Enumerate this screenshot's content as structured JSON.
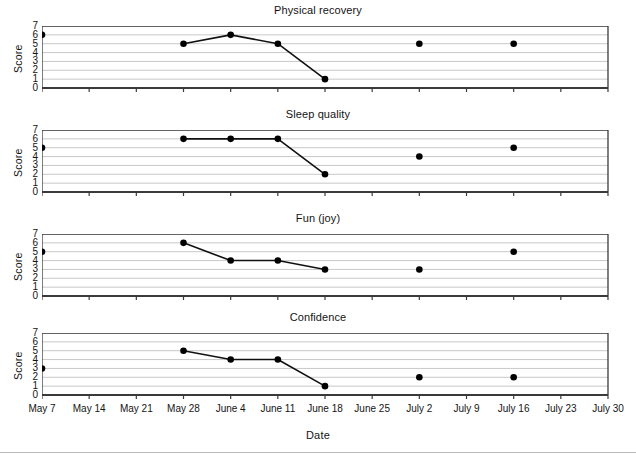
{
  "figure": {
    "xlabel": "Date",
    "ylabel": "Score"
  },
  "chart_data": [
    {
      "type": "line",
      "title": "Physical recovery",
      "xlabel": "Date",
      "ylabel": "Score",
      "ylim": [
        0,
        7
      ],
      "yticks": [
        0,
        1,
        2,
        3,
        4,
        5,
        6,
        7
      ],
      "grid": true,
      "legend": "none",
      "x": [
        "May 7",
        "May 14",
        "May 21",
        "May 28",
        "June 4",
        "June 11",
        "June 18",
        "June 25",
        "July 2",
        "July 9",
        "July 16",
        "July 23",
        "July 30"
      ],
      "points": [
        {
          "x": "May 7",
          "y": 6,
          "connected": false
        },
        {
          "x": "May 28",
          "y": 5,
          "connected": true
        },
        {
          "x": "June 4",
          "y": 6,
          "connected": true
        },
        {
          "x": "June 11",
          "y": 5,
          "connected": true
        },
        {
          "x": "June 18",
          "y": 1,
          "connected": true
        },
        {
          "x": "July 2",
          "y": 5,
          "connected": false
        },
        {
          "x": "July 16",
          "y": 5,
          "connected": false
        }
      ]
    },
    {
      "type": "line",
      "title": "Sleep quality",
      "xlabel": "Date",
      "ylabel": "Score",
      "ylim": [
        0,
        7
      ],
      "yticks": [
        0,
        1,
        2,
        3,
        4,
        5,
        6,
        7
      ],
      "grid": true,
      "legend": "none",
      "x": [
        "May 7",
        "May 14",
        "May 21",
        "May 28",
        "June 4",
        "June 11",
        "June 18",
        "June 25",
        "July 2",
        "July 9",
        "July 16",
        "July 23",
        "July 30"
      ],
      "points": [
        {
          "x": "May 7",
          "y": 5,
          "connected": false
        },
        {
          "x": "May 28",
          "y": 6,
          "connected": true
        },
        {
          "x": "June 4",
          "y": 6,
          "connected": true
        },
        {
          "x": "June 11",
          "y": 6,
          "connected": true
        },
        {
          "x": "June 18",
          "y": 2,
          "connected": true
        },
        {
          "x": "July 2",
          "y": 4,
          "connected": false
        },
        {
          "x": "July 16",
          "y": 5,
          "connected": false
        }
      ]
    },
    {
      "type": "line",
      "title": "Fun (joy)",
      "xlabel": "Date",
      "ylabel": "Score",
      "ylim": [
        0,
        7
      ],
      "yticks": [
        0,
        1,
        2,
        3,
        4,
        5,
        6,
        7
      ],
      "grid": true,
      "legend": "none",
      "x": [
        "May 7",
        "May 14",
        "May 21",
        "May 28",
        "June 4",
        "June 11",
        "June 18",
        "June 25",
        "July 2",
        "July 9",
        "July 16",
        "July 23",
        "July 30"
      ],
      "points": [
        {
          "x": "May 7",
          "y": 5,
          "connected": false
        },
        {
          "x": "May 28",
          "y": 6,
          "connected": true
        },
        {
          "x": "June 4",
          "y": 4,
          "connected": true
        },
        {
          "x": "June 11",
          "y": 4,
          "connected": true
        },
        {
          "x": "June 18",
          "y": 3,
          "connected": true
        },
        {
          "x": "July 2",
          "y": 3,
          "connected": false
        },
        {
          "x": "July 16",
          "y": 5,
          "connected": false
        }
      ]
    },
    {
      "type": "line",
      "title": "Confidence",
      "xlabel": "Date",
      "ylabel": "Score",
      "ylim": [
        0,
        7
      ],
      "yticks": [
        0,
        1,
        2,
        3,
        4,
        5,
        6,
        7
      ],
      "grid": true,
      "legend": "none",
      "x": [
        "May 7",
        "May 14",
        "May 21",
        "May 28",
        "June 4",
        "June 11",
        "June 18",
        "June 25",
        "July 2",
        "July 9",
        "July 16",
        "July 23",
        "July 30"
      ],
      "points": [
        {
          "x": "May 7",
          "y": 3,
          "connected": false
        },
        {
          "x": "May 28",
          "y": 5,
          "connected": true
        },
        {
          "x": "June 4",
          "y": 4,
          "connected": true
        },
        {
          "x": "June 11",
          "y": 4,
          "connected": true
        },
        {
          "x": "June 18",
          "y": 1,
          "connected": true
        },
        {
          "x": "July 2",
          "y": 2,
          "connected": false
        },
        {
          "x": "July 16",
          "y": 2,
          "connected": false
        }
      ]
    }
  ],
  "style": {
    "line_color": "#111111",
    "marker_color": "#000000",
    "grid_color": "#c8c8c8",
    "axis_color": "#3a3a3a"
  }
}
